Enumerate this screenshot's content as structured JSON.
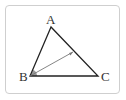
{
  "diagram": {
    "type": "triangle",
    "vertices": [
      {
        "label": "A",
        "x": 51,
        "y": 27,
        "label_x": 46,
        "label_y": 24
      },
      {
        "label": "B",
        "x": 30,
        "y": 76,
        "label_x": 19,
        "label_y": 81
      },
      {
        "label": "C",
        "x": 98,
        "y": 76,
        "label_x": 101,
        "label_y": 81
      }
    ],
    "segment": {
      "from": "B",
      "to_point_on": "AC",
      "x2": 73,
      "y2": 52
    },
    "angle_marker": {
      "at": "B",
      "color": "#999999"
    },
    "colors": {
      "stroke": "#222222",
      "segment": "#777777",
      "frame": "#cfcfcf"
    }
  }
}
